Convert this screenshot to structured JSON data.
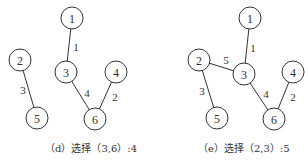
{
  "panels": [
    {
      "id": "d",
      "caption": "（d）选择（3,6）:4",
      "nodes": [
        {
          "id": "1",
          "x": 72,
          "y": 18
        },
        {
          "id": "2",
          "x": 20,
          "y": 60
        },
        {
          "id": "3",
          "x": 66,
          "y": 72
        },
        {
          "id": "4",
          "x": 116,
          "y": 72
        },
        {
          "id": "5",
          "x": 37,
          "y": 118
        },
        {
          "id": "6",
          "x": 95,
          "y": 119
        }
      ],
      "edges": [
        {
          "from": "1",
          "to": "3",
          "weight": "1",
          "lx": 76,
          "ly": 47
        },
        {
          "from": "2",
          "to": "5",
          "weight": "3",
          "lx": 23,
          "ly": 90
        },
        {
          "from": "3",
          "to": "6",
          "weight": "4",
          "lx": 87,
          "ly": 93
        },
        {
          "from": "4",
          "to": "6",
          "weight": "2",
          "lx": 115,
          "ly": 97
        }
      ]
    },
    {
      "id": "e",
      "caption": "（e）选择（2,3）:5",
      "nodes": [
        {
          "id": "1",
          "x": 250,
          "y": 18
        },
        {
          "id": "2",
          "x": 199,
          "y": 60
        },
        {
          "id": "3",
          "x": 244,
          "y": 74
        },
        {
          "id": "4",
          "x": 293,
          "y": 72
        },
        {
          "id": "5",
          "x": 217,
          "y": 118
        },
        {
          "id": "6",
          "x": 274,
          "y": 119
        }
      ],
      "edges": [
        {
          "from": "1",
          "to": "3",
          "weight": "1",
          "lx": 253,
          "ly": 48
        },
        {
          "from": "2",
          "to": "3",
          "weight": "5",
          "lx": 226,
          "ly": 60
        },
        {
          "from": "2",
          "to": "5",
          "weight": "3",
          "lx": 202,
          "ly": 91
        },
        {
          "from": "3",
          "to": "6",
          "weight": "4",
          "lx": 266,
          "ly": 94
        },
        {
          "from": "4",
          "to": "6",
          "weight": "2",
          "lx": 293,
          "ly": 97
        }
      ]
    }
  ]
}
